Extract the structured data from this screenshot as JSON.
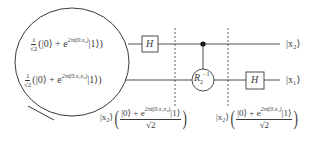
{
  "diagram": {
    "type": "quantum-circuit",
    "title": "",
    "colors": {
      "line": "#3a3a3a",
      "background": "#ffffff"
    },
    "input_states": [
      {
        "prefactor_num": "1",
        "prefactor_den": "√2",
        "ket0": "(|0⟩ + e",
        "exponent": "2πi(0.x₂)",
        "ket1": "|1⟩)"
      },
      {
        "prefactor_num": "1",
        "prefactor_den": "√2",
        "ket0": "(|0⟩ + e",
        "exponent": "2πi(0.x₁x₂)",
        "ket1": "|1⟩)"
      }
    ],
    "gates": {
      "h_top": "H",
      "controlled_rotation": "R",
      "controlled_rotation_sub": "2",
      "controlled_rotation_sup": "−1",
      "h_bottom": "H"
    },
    "outputs": {
      "top": "|x₂⟩",
      "bottom": "|x₁⟩"
    },
    "intermediate_states": [
      {
        "ket": "|x₂⟩",
        "numerator_pre": "|0⟩ + e",
        "exponent": "2πi(0.x₁x₂)",
        "numerator_post": "|1⟩",
        "denominator": "√2"
      },
      {
        "ket": "|x₂⟩",
        "numerator_pre": "|0⟩ + e",
        "exponent": "2πi(0.x₁)",
        "numerator_post": "|1⟩",
        "denominator": "√2"
      }
    ]
  }
}
